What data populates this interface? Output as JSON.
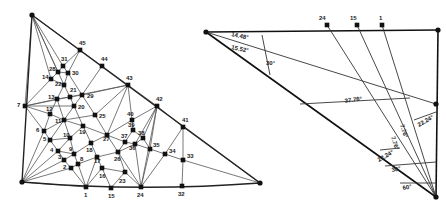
{
  "mesh": {
    "corners": {
      "top": [
        32,
        15
      ],
      "left": [
        22,
        182
      ],
      "right": [
        260,
        183
      ]
    },
    "nodes": [
      {
        "id": "1",
        "x": 86,
        "y": 187,
        "lx": 84,
        "ly": 197
      },
      {
        "id": "2",
        "x": 71,
        "y": 168,
        "lx": 63,
        "ly": 169
      },
      {
        "id": "3",
        "x": 64,
        "y": 160,
        "lx": 58,
        "ly": 159
      },
      {
        "id": "4",
        "x": 58,
        "y": 151,
        "lx": 50,
        "ly": 152
      },
      {
        "id": "5",
        "x": 50,
        "y": 140,
        "lx": 43,
        "ly": 141
      },
      {
        "id": "6",
        "x": 44,
        "y": 131,
        "lx": 36,
        "ly": 132
      },
      {
        "id": "7",
        "x": 25,
        "y": 106,
        "lx": 17,
        "ly": 107
      },
      {
        "id": "8",
        "x": 78,
        "y": 164,
        "lx": 80,
        "ly": 161
      },
      {
        "id": "9",
        "x": 74,
        "y": 154,
        "lx": 69,
        "ly": 151
      },
      {
        "id": "10",
        "x": 70,
        "y": 138,
        "lx": 63,
        "ly": 137
      },
      {
        "id": "11",
        "x": 64,
        "y": 120,
        "lx": 55,
        "ly": 123
      },
      {
        "id": "12",
        "x": 50,
        "y": 114,
        "lx": 46,
        "ly": 111
      },
      {
        "id": "13",
        "x": 57,
        "y": 99,
        "lx": 48,
        "ly": 99
      },
      {
        "id": "14",
        "x": 51,
        "y": 79,
        "lx": 42,
        "ly": 79
      },
      {
        "id": "15",
        "x": 111,
        "y": 188,
        "lx": 108,
        "ly": 198
      },
      {
        "id": "16",
        "x": 102,
        "y": 168,
        "lx": 99,
        "ly": 178
      },
      {
        "id": "17",
        "x": 97,
        "y": 157,
        "lx": 94,
        "ly": 163
      },
      {
        "id": "18",
        "x": 91,
        "y": 143,
        "lx": 86,
        "ly": 152
      },
      {
        "id": "19",
        "x": 83,
        "y": 126,
        "lx": 79,
        "ly": 134
      },
      {
        "id": "20",
        "x": 74,
        "y": 106,
        "lx": 78,
        "ly": 109
      },
      {
        "id": "21",
        "x": 70,
        "y": 97,
        "lx": 70,
        "ly": 92
      },
      {
        "id": "22",
        "x": 64,
        "y": 85,
        "lx": 55,
        "ly": 86
      },
      {
        "id": "23",
        "x": 125,
        "y": 172,
        "lx": 119,
        "ly": 183
      },
      {
        "id": "24",
        "x": 141,
        "y": 187,
        "lx": 137,
        "ly": 197
      },
      {
        "id": "25",
        "x": 95,
        "y": 115,
        "lx": 99,
        "ly": 118
      },
      {
        "id": "26",
        "x": 118,
        "y": 152,
        "lx": 114,
        "ly": 161
      },
      {
        "id": "27",
        "x": 107,
        "y": 135,
        "lx": 103,
        "ly": 141
      },
      {
        "id": "28",
        "x": 58,
        "y": 72,
        "lx": 49,
        "ly": 71
      },
      {
        "id": "29",
        "x": 82,
        "y": 95,
        "lx": 87,
        "ly": 98
      },
      {
        "id": "30",
        "x": 68,
        "y": 73,
        "lx": 72,
        "ly": 75
      },
      {
        "id": "31",
        "x": 63,
        "y": 66,
        "lx": 61,
        "ly": 61
      },
      {
        "id": "32",
        "x": 182,
        "y": 186,
        "lx": 178,
        "ly": 196
      },
      {
        "id": "33",
        "x": 183,
        "y": 160,
        "lx": 187,
        "ly": 158
      },
      {
        "id": "34",
        "x": 165,
        "y": 154,
        "lx": 169,
        "ly": 153
      },
      {
        "id": "35",
        "x": 150,
        "y": 149,
        "lx": 153,
        "ly": 147
      },
      {
        "id": "36",
        "x": 135,
        "y": 144,
        "lx": 129,
        "ly": 150
      },
      {
        "id": "37",
        "x": 125,
        "y": 142,
        "lx": 121,
        "ly": 138
      },
      {
        "id": "38",
        "x": 143,
        "y": 138,
        "lx": 138,
        "ly": 135
      },
      {
        "id": "39",
        "x": 133,
        "y": 130,
        "lx": 128,
        "ly": 127
      },
      {
        "id": "40",
        "x": 132,
        "y": 120,
        "lx": 127,
        "ly": 116
      },
      {
        "id": "41",
        "x": 183,
        "y": 127,
        "lx": 182,
        "ly": 122
      },
      {
        "id": "42",
        "x": 157,
        "y": 106,
        "lx": 156,
        "ly": 101
      },
      {
        "id": "43",
        "x": 128,
        "y": 85,
        "lx": 126,
        "ly": 80
      },
      {
        "id": "44",
        "x": 102,
        "y": 66,
        "lx": 101,
        "ly": 61
      },
      {
        "id": "45",
        "x": 80,
        "y": 50,
        "lx": 79,
        "ly": 45
      }
    ]
  },
  "angle_diagram": {
    "apex": [
      206,
      32
    ],
    "bottom_vertex": [
      436,
      197
    ],
    "top_nodes": [
      {
        "id": "24",
        "x": 327,
        "y": 25,
        "lx": 319,
        "ly": 20
      },
      {
        "id": "15",
        "x": 357,
        "y": 25,
        "lx": 350,
        "ly": 20
      },
      {
        "id": "1",
        "x": 382,
        "y": 25,
        "lx": 379,
        "ly": 20
      }
    ],
    "angles": [
      {
        "label": "14.48°",
        "x": 231,
        "y": 36,
        "rot": 12
      },
      {
        "label": "15.52°",
        "x": 231,
        "y": 49,
        "rot": 12
      },
      {
        "label": "30°",
        "x": 266,
        "y": 65,
        "rot": 0
      },
      {
        "label": "37.76°",
        "x": 345,
        "y": 103,
        "rot": -8
      },
      {
        "label": "7.76°",
        "x": 400,
        "y": 125,
        "rot": 72
      },
      {
        "label": "7.76°",
        "x": 391,
        "y": 137,
        "rot": 72
      },
      {
        "label": "22.24°",
        "x": 419,
        "y": 127,
        "rot": -30
      },
      {
        "label": "22.24°",
        "x": 379,
        "y": 162,
        "rot": -30
      },
      {
        "label": "30°",
        "x": 392,
        "y": 172,
        "rot": -10
      },
      {
        "label": "60°",
        "x": 403,
        "y": 190,
        "rot": -10
      }
    ]
  }
}
